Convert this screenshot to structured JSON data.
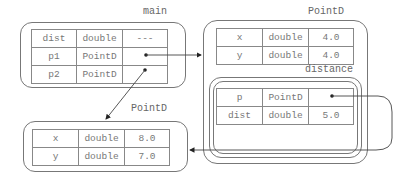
{
  "frames": {
    "main": {
      "label": "main",
      "rows": [
        {
          "name": "dist",
          "type": "double",
          "value": "---"
        },
        {
          "name": "p1",
          "type": "PointD",
          "value": ""
        },
        {
          "name": "p2",
          "type": "PointD",
          "value": ""
        }
      ]
    },
    "pointd_top": {
      "label": "PointD",
      "rows": [
        {
          "name": "x",
          "type": "double",
          "value": "4.0"
        },
        {
          "name": "y",
          "type": "double",
          "value": "4.0"
        }
      ]
    },
    "distance": {
      "label": "distance",
      "rows": [
        {
          "name": "p",
          "type": "PointD",
          "value": ""
        },
        {
          "name": "dist",
          "type": "double",
          "value": "5.0"
        }
      ]
    },
    "pointd_bottom": {
      "label": "PointD",
      "rows": [
        {
          "name": "x",
          "type": "double",
          "value": "8.0"
        },
        {
          "name": "y",
          "type": "double",
          "value": "7.0"
        }
      ]
    }
  },
  "arrows": [
    {
      "from": "main.p1",
      "to": "pointd_top"
    },
    {
      "from": "main.p2",
      "to": "pointd_bottom"
    },
    {
      "from": "distance.p",
      "to": "pointd_bottom"
    }
  ]
}
